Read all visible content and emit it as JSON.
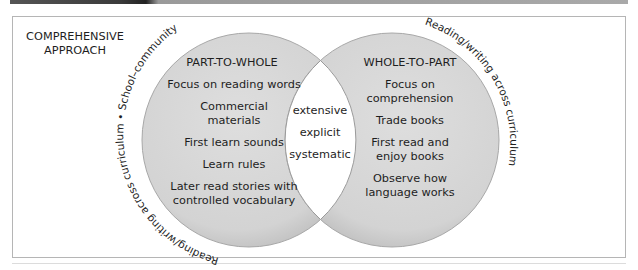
{
  "title": {
    "line1": "COMPREHENSIVE",
    "line2": "APPROACH"
  },
  "left_circle": {
    "heading": "PART-TO-WHOLE",
    "items": [
      "Focus on reading words",
      "Commercial",
      "materials",
      "First learn sounds",
      "Learn rules",
      "Later read stories with",
      "controlled vocabulary"
    ]
  },
  "right_circle": {
    "heading": "WHOLE-TO-PART",
    "items": [
      "Focus on",
      "comprehension",
      "Trade books",
      "First read and",
      "enjoy books",
      "Observe how",
      "language works"
    ]
  },
  "intersection": {
    "items": [
      "extensive",
      "explicit",
      "systematic"
    ]
  },
  "arc_labels": {
    "left": "Reading/writing across curriculum • School–community",
    "right": "Reading/writing across curriculum"
  },
  "colors": {
    "circle_fill": "#d6d6d6",
    "circle_edge": "#a8a8a8",
    "intersection_fill": "#ffffff",
    "text": "#1e1e1e",
    "frame": "#b5b5b5"
  }
}
